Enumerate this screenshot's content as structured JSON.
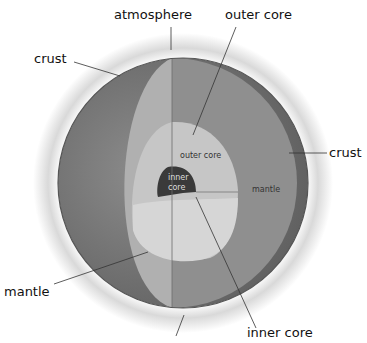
{
  "diagram": {
    "labels": {
      "atmosphere": "atmosphere",
      "outer_core_top": "outer core",
      "crust_left": "crust",
      "crust_right": "crust",
      "mantle_left": "mantle",
      "inner_core_bottom": "inner core"
    },
    "inner_labels": {
      "outer_core": "outer core",
      "mantle": "mantle",
      "inner_core_line1": "inner",
      "inner_core_line2": "core"
    },
    "colors": {
      "atmosphere_glow": "#e6e6e6",
      "surface": "#7a7a7a",
      "crust_edge": "#5a5a5a",
      "mantle": "#8a8a8a",
      "cut_face": "#b5b5b5",
      "outer_core": "#c4c4c4",
      "inner_core": "#3c3c3c"
    }
  }
}
